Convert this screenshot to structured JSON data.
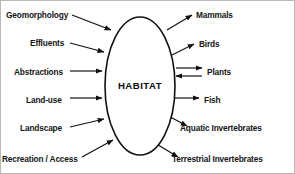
{
  "diagram": {
    "type": "radial-concept-map",
    "center": {
      "label": "HABITAT",
      "shape": "ellipse",
      "cx": 140,
      "cy": 86,
      "rx": 35,
      "ry": 69
    },
    "stroke_color": "#111111",
    "text_color": "#141414",
    "background_color": "#ffffff",
    "border_color": "#b9b9b9",
    "inputs": [
      {
        "label": "Geomorphology",
        "side": "left",
        "direction": "into-center",
        "label_x": 6,
        "label_y": 11,
        "line": {
          "x1": 72,
          "y1": 15,
          "x2": 111,
          "y2": 30
        }
      },
      {
        "label": "Effluents",
        "side": "left",
        "direction": "into-center",
        "label_x": 30,
        "label_y": 39,
        "line": {
          "x1": 70,
          "y1": 43,
          "x2": 104,
          "y2": 52
        }
      },
      {
        "label": "Abstractions",
        "side": "left",
        "direction": "into-center",
        "label_x": 14,
        "label_y": 68,
        "line": {
          "x1": 70,
          "y1": 71,
          "x2": 102,
          "y2": 71
        }
      },
      {
        "label": "Land-use",
        "side": "left",
        "direction": "into-center",
        "label_x": 26,
        "label_y": 96,
        "line": {
          "x1": 70,
          "y1": 98,
          "x2": 102,
          "y2": 98
        }
      },
      {
        "label": "Landscape",
        "side": "left",
        "direction": "into-center",
        "label_x": 20,
        "label_y": 124,
        "line": {
          "x1": 70,
          "y1": 127,
          "x2": 104,
          "y2": 119
        }
      },
      {
        "label": "Recreation / Access",
        "side": "left",
        "direction": "into-center",
        "label_x": 2,
        "label_y": 155,
        "line": {
          "x1": 82,
          "y1": 157,
          "x2": 113,
          "y2": 140
        }
      }
    ],
    "outputs": [
      {
        "label": "Mammals",
        "side": "right",
        "direction": "out-of-center",
        "label_x": 196,
        "label_y": 11,
        "line": {
          "x1": 167,
          "y1": 30,
          "x2": 192,
          "y2": 15
        }
      },
      {
        "label": "Birds",
        "side": "right",
        "direction": "out-of-center",
        "label_x": 199,
        "label_y": 40,
        "line": {
          "x1": 172,
          "y1": 55,
          "x2": 194,
          "y2": 44
        }
      },
      {
        "label": "Plants",
        "side": "right",
        "direction": "bidirectional",
        "label_x": 207,
        "label_y": 68,
        "line": {
          "x1": 176,
          "y1": 68,
          "x2": 202,
          "y2": 68
        },
        "line2": {
          "x1": 202,
          "y1": 76,
          "x2": 176,
          "y2": 76
        }
      },
      {
        "label": "Fish",
        "side": "right",
        "direction": "out-of-center",
        "label_x": 204,
        "label_y": 96,
        "line": {
          "x1": 172,
          "y1": 98,
          "x2": 199,
          "y2": 98
        }
      },
      {
        "label": "Aquatic Invertebrates",
        "side": "right",
        "direction": "out-of-center",
        "label_x": 180,
        "label_y": 124,
        "line": {
          "x1": 163,
          "y1": 113,
          "x2": 187,
          "y2": 126
        }
      },
      {
        "label": "Terrestrial Invertebrates",
        "side": "right",
        "direction": "out-of-center",
        "label_x": 172,
        "label_y": 155,
        "line": {
          "x1": 150,
          "y1": 140,
          "x2": 178,
          "y2": 157
        }
      }
    ]
  }
}
